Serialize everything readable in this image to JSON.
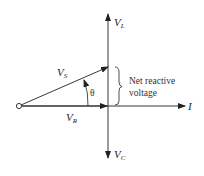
{
  "diagram": {
    "type": "phasor-diagram",
    "labels": {
      "vl": {
        "main": "V",
        "sub": "L"
      },
      "vc": {
        "main": "V",
        "sub": "C"
      },
      "vs": {
        "main": "V",
        "sub": "S"
      },
      "vr": {
        "main": "V",
        "sub": "R"
      },
      "i": "I",
      "theta": "θ",
      "net_reactive_line1": "Net reactive",
      "net_reactive_line2": "voltage"
    },
    "colors": {
      "stroke": "#222222",
      "background": "#ffffff"
    }
  }
}
